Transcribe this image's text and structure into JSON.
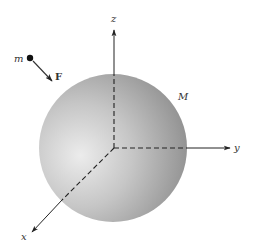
{
  "diagram": {
    "type": "3d-coordinate-sphere",
    "sphere": {
      "label": "M",
      "cx": 113,
      "cy": 148,
      "r": 75,
      "color_light": "#e6e6e6",
      "color_dark": "#8a8a8a"
    },
    "axes": [
      {
        "name": "z",
        "label": "z",
        "direction": "up"
      },
      {
        "name": "y",
        "label": "y",
        "direction": "right"
      },
      {
        "name": "x",
        "label": "x",
        "direction": "down-left"
      }
    ],
    "particle": {
      "label": "m",
      "force_label": "F"
    },
    "colors": {
      "ink": "#333333",
      "background": "#ffffff"
    }
  }
}
